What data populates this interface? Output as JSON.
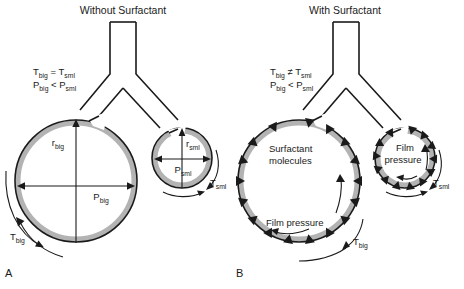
{
  "figure": {
    "panels": [
      {
        "id": "A",
        "panel_label": "A",
        "title": "Without Surfactant",
        "equations": {
          "tension": "T",
          "tension_sub_big": "big",
          "tension_rel": " = T",
          "tension_sub_sml": "sml",
          "pressure": "P",
          "pressure_sub_big": "big",
          "pressure_rel": " < P",
          "pressure_sub_sml": "sml"
        },
        "labels": {
          "radius_big": "r",
          "radius_big_sub": "big",
          "pressure_big": "P",
          "pressure_big_sub": "big",
          "tension_big": "T",
          "tension_big_sub": "big",
          "radius_sml": "r",
          "radius_sml_sub": "sml",
          "pressure_sml": "P",
          "pressure_sml_sub": "sml",
          "tension_sml": "T",
          "tension_sml_sub": "sml"
        }
      },
      {
        "id": "B",
        "panel_label": "B",
        "title": "With Surfactant",
        "equations": {
          "tension": "T",
          "tension_sub_big": "big",
          "tension_rel": " ≠ T",
          "tension_sub_sml": "sml",
          "pressure": "P",
          "pressure_sub_big": "big",
          "pressure_rel": " < P",
          "pressure_sub_sml": "sml"
        },
        "labels": {
          "surfactant_line1": "Surfactant",
          "surfactant_line2": "molecules",
          "film_pressure_big": "Film pressure",
          "film_pressure_sml_line1": "Film",
          "film_pressure_sml_line2": "pressure",
          "tension_big": "T",
          "tension_big_sub": "big",
          "tension_sml": "T",
          "tension_sml_sub": "sml"
        }
      }
    ],
    "colors": {
      "outline": "#1a1a1a",
      "film_layer": "#b3b3b3",
      "background": "#ffffff"
    }
  }
}
